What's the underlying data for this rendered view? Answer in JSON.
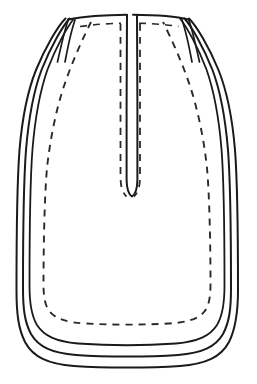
{
  "figure": {
    "background_color": "#ffffff",
    "stroke_color": "#1a1a1a",
    "dash_color": "#2a2a2a",
    "canvas": {
      "width": 257,
      "height": 384
    }
  },
  "drawing": {
    "type": "line-drawing",
    "subject": "pouch",
    "contour_count": 3,
    "has_dashed_stitching": true,
    "outlines": [
      {
        "name": "outer-contour",
        "stroke_width": 2.0,
        "path": "M 65.5 18.5 C 58 26 46 46 36 70 C 28 90 22 120 19.5 150 C 17.5 176 16.5 230 16.5 290 C 16.5 312 18 328 25 342 C 33 357 48 364 74 366 C 104 368 150 368 180 366 C 206 364 221 357 229 342 C 236 328 238 312 238 290 C 238 230 237 176 235 150 C 232.5 120 226.5 90 218.5 70 C 208.5 46 196.5 26 189 18.5"
      },
      {
        "name": "middle-contour",
        "stroke_width": 2.0,
        "path": "M 69.5 18.5 C 62.5 26.5 51 46 41.5 70 C 34 90 28.5 120 26 150 C 24 176 23 230 23 288 C 23 308 24.5 322 31 334 C 38.5 347 52 353 76 355 C 105 357 149 357 178 355 C 202 353 215.5 347 223 334 C 229.5 322 231 308 231 288 C 231 230 230 176 228 150 C 225.5 120 220 90 212.5 70 C 203 46 191.5 26.5 184.5 18.5"
      },
      {
        "name": "inner-contour",
        "stroke_width": 1.8,
        "path": "M 74 18.5 C 67.5 26.5 56.5 46 47.5 69.5 C 40.5 89.5 35 119 32.5 149 C 30.5 175 29.5 228 29.5 286 C 29.5 303 31 315 37 325 C 44 336 56 341.5 78 343.5 C 106 345.5 148 345.5 176 343.5 C 198 341.5 210 336 217 325 C 223 315 224.5 303 224.5 286 C 224.5 228 223.5 175 221.5 149 C 219 119 213.5 89.5 206.5 69.5 C 197.5 46 186.5 26.5 180 18.5"
      }
    ],
    "dashed_lines": [
      {
        "name": "body-stitch-line",
        "stroke_width": 1.9,
        "dash_pattern": "7 6",
        "path": "M 91 22 C 83 38 72 62 64 86 C 56 110 50 140 47 168 C 44.5 196 43.5 246 43.5 284 C 43.5 297 45 306 50 312 C 56 319 67 322.5 86 323.5 C 110 325 144 325 168 323.5 C 187 322.5 198 319 204 312 C 209 306 210.5 297 210.5 284 C 210.5 246 209.5 196 207 168 C 204 140 198 110 190 86 C 182 62 171 38 163 22"
      },
      {
        "name": "slit-stitch-left",
        "stroke_width": 1.8,
        "dash_pattern": "7 6",
        "path": "M 120.5 24 C 120.5 60 120.5 120 120.5 176 C 120.5 186 122 192 126.5 196.5"
      },
      {
        "name": "slit-stitch-right",
        "stroke_width": 1.8,
        "dash_pattern": "7 6",
        "path": "M 140 24 C 140 60 140 120 140 176 C 140 186 138.5 192 134 196.5"
      },
      {
        "name": "top-rim-stitch-left",
        "stroke_width": 1.6,
        "dash_pattern": "7 6",
        "path": "M 80 26.5 C 94 24.5 108 23.5 121 23.2"
      },
      {
        "name": "top-rim-stitch-right",
        "stroke_width": 1.6,
        "dash_pattern": "7 6",
        "path": "M 139 23.2 C 152 23.5 166 24.5 178.5 26.5"
      }
    ],
    "neck": {
      "name": "neck-slit",
      "top_left_x": 68,
      "top_right_x": 185,
      "top_y": 18,
      "slit_left_x": 127,
      "slit_right_x": 133,
      "slit_bottom_y": 196,
      "rim_path_left": "M 68 19.5 C 84 16.5 104 15 127 14.8",
      "rim_path_right": "M 133 14.8 C 156 15 176.5 16.5 188.5 19.5",
      "slit_path": "M 127 15.5 C 126.6 60 126.5 130 126.6 180 C 126.8 189 128.5 194.5 132 196.5 C 135.5 194.5 137.2 189 137.4 180 C 137.5 130 137.4 60 137 15.5"
    },
    "neck_side_folds": [
      {
        "name": "fold-left-outer",
        "stroke_width": 1.7,
        "path": "M 68.5 19 C 65 29 61 46 57.5 62"
      },
      {
        "name": "fold-left-inner",
        "stroke_width": 1.7,
        "path": "M 75 20 C 71.5 30 68 46 65 62"
      },
      {
        "name": "fold-right-outer",
        "stroke_width": 1.7,
        "path": "M 188.5 19 C 192 29 196 46 199.5 62"
      },
      {
        "name": "fold-right-inner",
        "stroke_width": 1.7,
        "path": "M 182 20 C 185.5 30 189 46 192 62"
      }
    ]
  }
}
